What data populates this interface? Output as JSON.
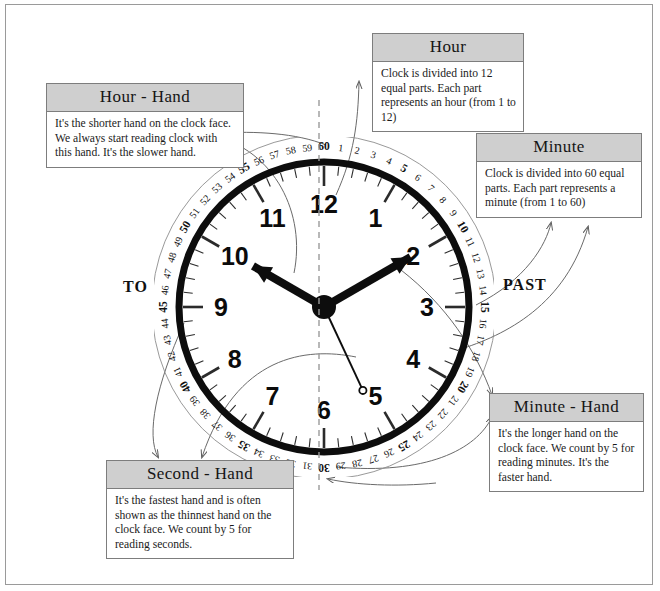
{
  "diagram": {
    "side_labels": {
      "left": "TO",
      "right": "PAST"
    }
  },
  "callouts": [
    {
      "id": "hour-hand",
      "title": "Hour - Hand",
      "body": "It's the shorter hand on the clock face. We always start reading clock with this hand. It's the slower hand."
    },
    {
      "id": "hour",
      "title": "Hour",
      "body": "Clock is divided into 12 equal parts. Each part represents an hour (from 1 to 12)"
    },
    {
      "id": "minute",
      "title": "Minute",
      "body": "Clock is divided into 60 equal parts. Each part represents a minute (from 1 to 60)"
    },
    {
      "id": "minute-hand",
      "title": "Minute - Hand",
      "body": "It's the longer hand on the clock face. We count by 5 for reading minutes. It's the faster hand."
    },
    {
      "id": "second-hand",
      "title": "Second - Hand",
      "body": "It's the fastest hand and is often shown as the thinnest hand on the clock face. We count by 5 for reading seconds."
    }
  ],
  "clock": {
    "hour_numbers": [
      "12",
      "1",
      "2",
      "3",
      "4",
      "5",
      "6",
      "7",
      "8",
      "9",
      "10",
      "11"
    ],
    "minute_numbers": [
      "60",
      "1",
      "2",
      "3",
      "4",
      "5",
      "6",
      "7",
      "8",
      "9",
      "10",
      "11",
      "12",
      "13",
      "14",
      "15",
      "16",
      "17",
      "18",
      "19",
      "20",
      "21",
      "22",
      "23",
      "24",
      "25",
      "26",
      "27",
      "28",
      "29",
      "30",
      "31",
      "32",
      "33",
      "34",
      "35",
      "36",
      "37",
      "38",
      "39",
      "40",
      "41",
      "42",
      "43",
      "44",
      "45",
      "46",
      "47",
      "48",
      "49",
      "50",
      "51",
      "52",
      "53",
      "54",
      "55",
      "56",
      "57",
      "58",
      "59"
    ],
    "emphasized_minutes": [
      "60",
      "5",
      "10",
      "15",
      "20",
      "25",
      "30",
      "35",
      "40",
      "45",
      "50",
      "55"
    ],
    "hands": {
      "hour": {
        "points_to": "10",
        "angle_deg": 300
      },
      "minute": {
        "points_to": "2",
        "angle_deg": 60
      },
      "second": {
        "points_to": "5",
        "angle_deg": 155
      }
    },
    "colors": {
      "ring": "#0d0d0d",
      "hand": "#0d0d0d",
      "tick": "#2b2b2b",
      "axis_dash": "#9b9b9b",
      "connector": "#6a6a6a"
    }
  }
}
